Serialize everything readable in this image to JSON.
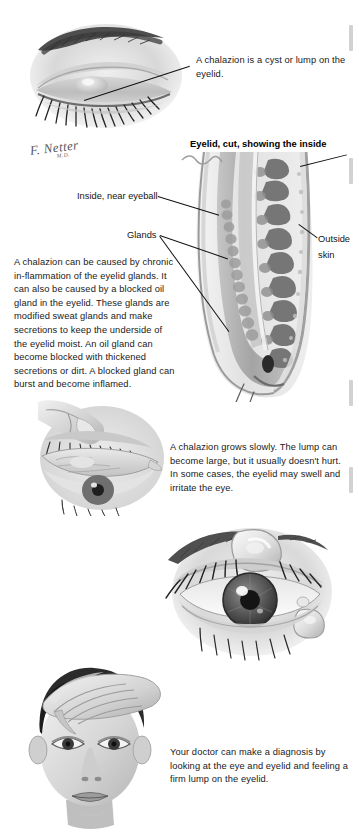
{
  "document": {
    "title": "Chalazion patient education illustration page",
    "artist_signature": "F. Netter",
    "artist_signature_sub": "M.D."
  },
  "figures": [
    {
      "id": "closed-eye-lump",
      "name": "closed-eye-with-chalazion-illustration",
      "description": "Grayscale drawing of a closed eye with eyebrow and lashes showing a lump on the upper eyelid"
    },
    {
      "id": "eyelid-cross-section",
      "name": "eyelid-cross-section-illustration",
      "description": "Histologic cross section of an eyelid showing meibomian glands, conjunctival surface and outer skin"
    },
    {
      "id": "everted-eyelid",
      "name": "everted-eyelid-illustration",
      "description": "Finger pulling down the lower eyelid to expose the inner eyelid surface"
    },
    {
      "id": "open-eye-lumps",
      "name": "open-eye-with-lumps-illustration",
      "description": "Close-up of an open eye with raised cyst-like lumps on the upper and lower eyelids"
    },
    {
      "id": "doctor-exam",
      "name": "physician-examining-eyelid-illustration",
      "description": "Face of a patient with a hand holding the upper eyelid during examination"
    }
  ],
  "callouts": [
    {
      "name": "chalazion-definition-callout",
      "text": "A chalazion is a cyst or lump on the eyelid."
    }
  ],
  "headings": {
    "cross_section": "Eyelid, cut, showing the inside"
  },
  "diagram_labels": [
    {
      "name": "label-inside-near-eyeball",
      "text": "Inside, near eyeball"
    },
    {
      "name": "label-glands",
      "text": "Glands"
    },
    {
      "name": "label-outside-skin-line1",
      "text": "Outside"
    },
    {
      "name": "label-outside-skin-line2",
      "text": "skin"
    }
  ],
  "body_text": {
    "causes": "A chalazion can be caused by chronic in-flammation of the eyelid glands. It can also be caused by a blocked oil gland in the eyelid. These glands are modified sweat glands and make secretions to keep the underside of the eyelid moist. An oil gland can become blocked with thickened secretions or dirt. A blocked gland can burst and become inflamed.",
    "symptoms": "A chalazion grows slowly. The lump can become large, but it usually doesn't hurt. In some cases, the eyelid may swell and irritate the eye.",
    "diagnosis": "Your doctor can make a diagnosis by looking at the eye and eyelid and feeling a firm lump on the eyelid."
  },
  "colors": {
    "background": "#ffffff",
    "text": "#191919",
    "leader_line": "#111111",
    "edge_tick": "#d2d2d2",
    "illustration_mid": "#9a9a9a",
    "illustration_dark": "#4a4a4a"
  }
}
